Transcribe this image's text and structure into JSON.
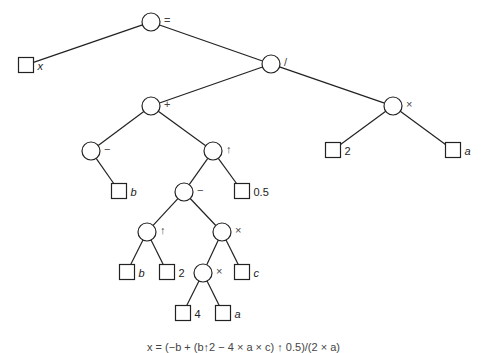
{
  "diagram": {
    "type": "expression-tree",
    "caption": "x = (−b + (b↑2 − 4 × a × c) ↑ 0.5)/(2 × a)",
    "colors": {
      "stroke": "#222222",
      "background": "#ffffff",
      "text": "#222222"
    },
    "nodes": [
      {
        "id": "eq",
        "kind": "operator",
        "label": "=",
        "cx": 151,
        "cy": 22
      },
      {
        "id": "x",
        "kind": "operand",
        "label": "x",
        "italic": true,
        "cx": 26,
        "cy": 65
      },
      {
        "id": "div",
        "kind": "operator",
        "label": "/",
        "cx": 271,
        "cy": 64
      },
      {
        "id": "plus",
        "kind": "operator",
        "label": "+",
        "cx": 151,
        "cy": 106
      },
      {
        "id": "mulR",
        "kind": "operator",
        "label": "×",
        "cx": 393,
        "cy": 106
      },
      {
        "id": "neg",
        "kind": "operator",
        "label": "−",
        "cx": 91,
        "cy": 151
      },
      {
        "id": "pow1",
        "kind": "operator",
        "label": "↑",
        "cx": 213,
        "cy": 151
      },
      {
        "id": "two1",
        "kind": "operand",
        "label": "2",
        "italic": false,
        "cx": 333,
        "cy": 150
      },
      {
        "id": "a1",
        "kind": "operand",
        "label": "a",
        "italic": true,
        "cx": 453,
        "cy": 150
      },
      {
        "id": "b1",
        "kind": "operand",
        "label": "b",
        "italic": true,
        "cx": 119,
        "cy": 191
      },
      {
        "id": "minus",
        "kind": "operator",
        "label": "−",
        "cx": 184,
        "cy": 192
      },
      {
        "id": "half",
        "kind": "operand",
        "label": "0.5",
        "italic": false,
        "cx": 242,
        "cy": 191
      },
      {
        "id": "pow2",
        "kind": "operator",
        "label": "↑",
        "cx": 147,
        "cy": 232
      },
      {
        "id": "mul2",
        "kind": "operator",
        "label": "×",
        "cx": 222,
        "cy": 232
      },
      {
        "id": "b2",
        "kind": "operand",
        "label": "b",
        "italic": true,
        "cx": 127,
        "cy": 272
      },
      {
        "id": "two2",
        "kind": "operand",
        "label": "2",
        "italic": false,
        "cx": 167,
        "cy": 272
      },
      {
        "id": "mul3",
        "kind": "operator",
        "label": "×",
        "cx": 203,
        "cy": 273
      },
      {
        "id": "c",
        "kind": "operand",
        "label": "c",
        "italic": true,
        "cx": 242,
        "cy": 272
      },
      {
        "id": "four",
        "kind": "operand",
        "label": "4",
        "italic": false,
        "cx": 183,
        "cy": 313
      },
      {
        "id": "a2",
        "kind": "operand",
        "label": "a",
        "italic": true,
        "cx": 223,
        "cy": 313
      }
    ],
    "edges": [
      [
        "eq",
        "x"
      ],
      [
        "eq",
        "div"
      ],
      [
        "div",
        "plus"
      ],
      [
        "div",
        "mulR"
      ],
      [
        "plus",
        "neg"
      ],
      [
        "plus",
        "pow1"
      ],
      [
        "mulR",
        "two1"
      ],
      [
        "mulR",
        "a1"
      ],
      [
        "neg",
        "b1"
      ],
      [
        "pow1",
        "minus"
      ],
      [
        "pow1",
        "half"
      ],
      [
        "minus",
        "pow2"
      ],
      [
        "minus",
        "mul2"
      ],
      [
        "pow2",
        "b2"
      ],
      [
        "pow2",
        "two2"
      ],
      [
        "mul2",
        "mul3"
      ],
      [
        "mul2",
        "c"
      ],
      [
        "mul3",
        "four"
      ],
      [
        "mul3",
        "a2"
      ]
    ]
  }
}
